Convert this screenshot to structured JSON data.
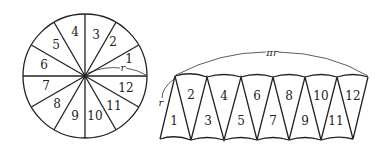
{
  "diagram": {
    "circle": {
      "sector_labels": [
        "1",
        "2",
        "3",
        "4",
        "5",
        "6",
        "7",
        "8",
        "9",
        "10",
        "11",
        "12"
      ],
      "radius_label": "r"
    },
    "strip": {
      "top_labels": [
        "2",
        "4",
        "6",
        "8",
        "10",
        "12"
      ],
      "bottom_labels": [
        "1",
        "3",
        "5",
        "7",
        "9",
        "11"
      ],
      "length_label": "πr",
      "height_label": "r"
    }
  }
}
